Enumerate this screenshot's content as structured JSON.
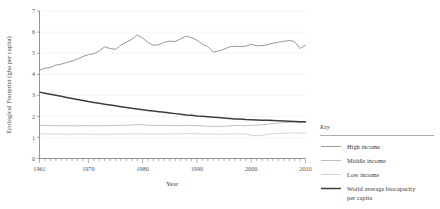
{
  "chart_data": {
    "type": "line",
    "title": "",
    "xlabel": "Year",
    "ylabel": "Ecological Footprint (gha per capita)",
    "xlim": [
      1961,
      2010
    ],
    "ylim": [
      0,
      7
    ],
    "grid": "horizontal-faint",
    "legend_position": "right",
    "legend_title": "Key",
    "xticks": [
      "1961",
      "1970",
      "1980",
      "1990",
      "2000",
      "2010"
    ],
    "xtick_values": [
      1961,
      1970,
      1980,
      1990,
      2000,
      2010
    ],
    "minor_xticks": "every year",
    "yticks": [
      "0",
      "1",
      "2",
      "3",
      "4",
      "5",
      "6",
      "7"
    ],
    "ytick_values": [
      0,
      1,
      2,
      3,
      4,
      5,
      6,
      7
    ],
    "x": [
      1961,
      1962,
      1963,
      1964,
      1965,
      1966,
      1967,
      1968,
      1969,
      1970,
      1971,
      1972,
      1973,
      1974,
      1975,
      1976,
      1977,
      1978,
      1979,
      1980,
      1981,
      1982,
      1983,
      1984,
      1985,
      1986,
      1987,
      1988,
      1989,
      1990,
      1991,
      1992,
      1993,
      1994,
      1995,
      1996,
      1997,
      1998,
      1999,
      2000,
      2001,
      2002,
      2003,
      2004,
      2005,
      2006,
      2007,
      2008,
      2009,
      2010
    ],
    "series": [
      {
        "name": "High income",
        "color": "#8c8c8c",
        "width": 0.9,
        "values": [
          4.2,
          4.28,
          4.32,
          4.43,
          4.48,
          4.55,
          4.62,
          4.72,
          4.84,
          4.93,
          4.97,
          5.1,
          5.3,
          5.22,
          5.18,
          5.38,
          5.52,
          5.66,
          5.86,
          5.72,
          5.5,
          5.37,
          5.4,
          5.52,
          5.57,
          5.55,
          5.68,
          5.8,
          5.74,
          5.62,
          5.42,
          5.31,
          5.05,
          5.1,
          5.19,
          5.3,
          5.33,
          5.31,
          5.33,
          5.42,
          5.35,
          5.36,
          5.4,
          5.47,
          5.52,
          5.56,
          5.6,
          5.55,
          5.22,
          5.38
        ]
      },
      {
        "name": "Middle income",
        "color": "#b4b4b4",
        "width": 0.8,
        "values": [
          1.57,
          1.57,
          1.56,
          1.56,
          1.55,
          1.56,
          1.55,
          1.55,
          1.56,
          1.56,
          1.55,
          1.55,
          1.56,
          1.56,
          1.57,
          1.57,
          1.58,
          1.59,
          1.61,
          1.6,
          1.58,
          1.57,
          1.57,
          1.57,
          1.57,
          1.56,
          1.56,
          1.57,
          1.57,
          1.56,
          1.55,
          1.53,
          1.52,
          1.52,
          1.53,
          1.55,
          1.57,
          1.56,
          1.56,
          1.57,
          1.58,
          1.6,
          1.63,
          1.66,
          1.68,
          1.7,
          1.72,
          1.73,
          1.7,
          1.72
        ]
      },
      {
        "name": "Low income",
        "color": "#cccccc",
        "width": 0.8,
        "values": [
          1.17,
          1.17,
          1.16,
          1.16,
          1.16,
          1.15,
          1.15,
          1.16,
          1.16,
          1.16,
          1.15,
          1.15,
          1.15,
          1.15,
          1.16,
          1.16,
          1.16,
          1.17,
          1.17,
          1.17,
          1.16,
          1.16,
          1.16,
          1.16,
          1.17,
          1.17,
          1.17,
          1.18,
          1.18,
          1.17,
          1.17,
          1.16,
          1.15,
          1.15,
          1.16,
          1.16,
          1.17,
          1.17,
          1.16,
          1.1,
          1.08,
          1.1,
          1.14,
          1.17,
          1.19,
          1.2,
          1.21,
          1.22,
          1.2,
          1.21
        ]
      },
      {
        "name": "World average biocapacity per capita",
        "color": "#3d3d3d",
        "width": 1.5,
        "values": [
          3.15,
          3.1,
          3.05,
          3.0,
          2.95,
          2.9,
          2.85,
          2.8,
          2.75,
          2.7,
          2.66,
          2.62,
          2.58,
          2.54,
          2.5,
          2.46,
          2.42,
          2.38,
          2.35,
          2.31,
          2.28,
          2.25,
          2.22,
          2.19,
          2.16,
          2.13,
          2.1,
          2.07,
          2.05,
          2.02,
          2.0,
          1.98,
          1.96,
          1.94,
          1.92,
          1.9,
          1.88,
          1.87,
          1.85,
          1.84,
          1.83,
          1.82,
          1.81,
          1.8,
          1.79,
          1.78,
          1.77,
          1.76,
          1.75,
          1.74
        ]
      }
    ]
  },
  "legend": {
    "title": "Key",
    "items": [
      {
        "label": "High income",
        "color": "#8c8c8c",
        "width": 0.9
      },
      {
        "label": "Middle income",
        "color": "#b4b4b4",
        "width": 0.8
      },
      {
        "label": "Low income",
        "color": "#cccccc",
        "width": 0.8
      },
      {
        "label": "World average biocapacity per capita",
        "color": "#3d3d3d",
        "width": 1.5
      }
    ],
    "item_label_0": "High income",
    "item_label_1": "Middle income",
    "item_label_2": "Low income",
    "item_label_3_line1": "World average biocapacity",
    "item_label_3_line2": "per capita"
  },
  "axes": {
    "ylabel": "Ecological Footprint (gha per capita)",
    "xlabel": "Year",
    "ytick_0": "0",
    "ytick_1": "1",
    "ytick_2": "2",
    "ytick_3": "3",
    "ytick_4": "4",
    "ytick_5": "5",
    "ytick_6": "6",
    "ytick_7": "7",
    "xtick_0": "1961",
    "xtick_1": "1970",
    "xtick_2": "1980",
    "xtick_3": "1990",
    "xtick_4": "2000",
    "xtick_5": "2010"
  },
  "colors": {
    "background": "#ffffff",
    "axis": "#7a7a7a",
    "grid": "#ededed",
    "text": "#3a3a3a"
  }
}
